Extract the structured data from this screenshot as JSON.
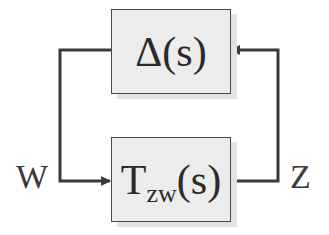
{
  "diagram": {
    "type": "feedback-loop block diagram",
    "blocks": [
      {
        "id": "delta",
        "label": "Δ(s)"
      },
      {
        "id": "tzw",
        "label_main": "T",
        "label_sub": "zw",
        "label_tail": "(s)"
      }
    ],
    "signals": {
      "input_label": "W",
      "output_label": "Z"
    },
    "edges": [
      {
        "from": "delta",
        "to": "tzw",
        "signal": "W",
        "route": "left"
      },
      {
        "from": "tzw",
        "to": "delta",
        "signal": "Z",
        "route": "right"
      }
    ],
    "colors": {
      "box_fill": "#ececec",
      "line": "#3a3a3a"
    }
  }
}
